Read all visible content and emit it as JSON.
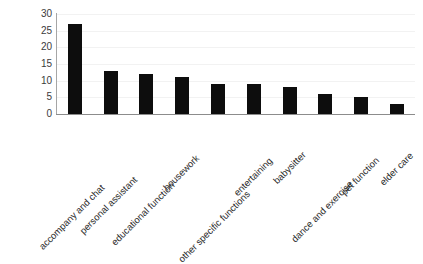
{
  "chart_data": {
    "type": "bar",
    "title": "",
    "subtitle": "",
    "xlabel": "",
    "ylabel": "",
    "categories": [
      "accompany and chat",
      "personal assistant",
      "educational function",
      "housework",
      "other specific functions",
      "entertaining",
      "babysitter",
      "dance and exercise",
      "pet function",
      "elder care"
    ],
    "values": [
      27,
      13,
      12,
      11,
      9,
      9,
      8,
      6,
      5,
      3
    ],
    "ylim": [
      0,
      30
    ],
    "yticks": [
      0,
      5,
      10,
      15,
      20,
      25,
      30
    ],
    "ytick_labels": [
      "0",
      "5",
      "10",
      "15",
      "20",
      "25",
      "30"
    ],
    "grid": true,
    "grid_axis": "y",
    "legend": false,
    "legend_position": "none",
    "bar_color": "#0d0d0d",
    "gridline_color": "#f2f2f2",
    "axis_color": "#8c8c8c",
    "background_color": "#ffffff",
    "xtick_label_rotation": -45
  }
}
